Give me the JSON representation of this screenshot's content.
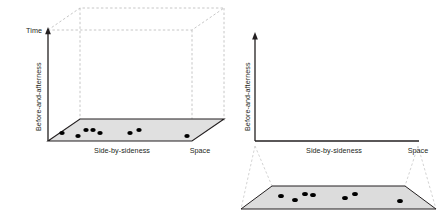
{
  "figure": {
    "panels": [
      {
        "id": "left",
        "name": "three-dimensional-cube-panel",
        "axes": {
          "vertical_top_label": "Time",
          "vertical_label": "Before-and-afterness",
          "horizontal_label": "Side-by-sideness",
          "depth_label": "Space"
        },
        "floor": {
          "fill": "#e0e0e0",
          "stroke": "#231f20"
        },
        "cube_edges_style": "dashed",
        "cube_edges_color": "#b3b3b3",
        "points": [
          {
            "x": 62,
            "y": 133
          },
          {
            "x": 78,
            "y": 136
          },
          {
            "x": 86,
            "y": 130
          },
          {
            "x": 93,
            "y": 130
          },
          {
            "x": 100,
            "y": 133
          },
          {
            "x": 130,
            "y": 133
          },
          {
            "x": 139,
            "y": 130
          },
          {
            "x": 187,
            "y": 136
          }
        ],
        "point_color": "#000000"
      },
      {
        "id": "right",
        "name": "two-dimensional-projection-panel",
        "axes": {
          "vertical_label": "Before-and-afterness",
          "horizontal_label": "Side-by-sideness",
          "corner_label": "Space"
        },
        "floor": {
          "fill": "#dcdcdc",
          "stroke": "#231f20"
        },
        "callout_style": "dashed",
        "callout_color": "#c8c8c8",
        "points": [
          {
            "x": 281,
            "y": 196
          },
          {
            "x": 295,
            "y": 200
          },
          {
            "x": 305,
            "y": 194
          },
          {
            "x": 313,
            "y": 195
          },
          {
            "x": 345,
            "y": 198
          },
          {
            "x": 355,
            "y": 194
          },
          {
            "x": 400,
            "y": 201
          }
        ],
        "point_color": "#000000"
      }
    ]
  },
  "colors": {
    "text": "#231f20",
    "axis": "#231f20",
    "dashed_guide": "#b8b8b8",
    "floor_fill": "#e0e0e0",
    "dot": "#000000",
    "background": "#ffffff"
  }
}
